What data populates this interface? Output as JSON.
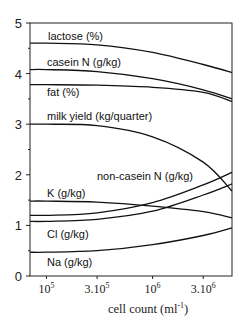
{
  "chart_data": {
    "type": "line",
    "title": "",
    "xlabel": "cell count (ml^-1)",
    "xlabel_parts": {
      "base": "cell count (ml",
      "sup": "-1",
      "end": ")"
    },
    "ylabel": "",
    "xscale": "log",
    "xlim": [
      70000,
      5600000
    ],
    "ylim": [
      0,
      5
    ],
    "grid": false,
    "legend": "inline labels",
    "y_ticks": [
      "0",
      "1",
      "2",
      "3",
      "4",
      "5"
    ],
    "x_ticks": [
      {
        "value": 100000,
        "base": "10",
        "sup": "5"
      },
      {
        "value": 300000,
        "base": "3.10",
        "sup": "5"
      },
      {
        "value": 1000000,
        "base": "10",
        "sup": "6"
      },
      {
        "value": 3000000,
        "base": "3.10",
        "sup": "6"
      }
    ],
    "x": [
      70000,
      100000,
      300000,
      1000000,
      3000000,
      5600000
    ],
    "series": [
      {
        "name": "lactose (%)",
        "values": [
          4.6,
          4.6,
          4.57,
          4.42,
          4.18,
          4.02
        ]
      },
      {
        "name": "casein N (g/kg)",
        "values": [
          4.08,
          4.08,
          4.04,
          3.9,
          3.68,
          3.5
        ]
      },
      {
        "name": "fat (%)",
        "values": [
          3.78,
          3.78,
          3.77,
          3.73,
          3.63,
          3.45
        ]
      },
      {
        "name": "milk yield (kg/quarter)",
        "values": [
          3.0,
          3.0,
          2.97,
          2.75,
          2.25,
          1.68
        ]
      },
      {
        "name": "non-casein N (g/kg)",
        "values": [
          1.2,
          1.2,
          1.25,
          1.45,
          1.8,
          2.05
        ]
      },
      {
        "name": "K (g/kg)",
        "values": [
          1.48,
          1.48,
          1.46,
          1.38,
          1.27,
          1.15
        ]
      },
      {
        "name": "Cl (g/kg)",
        "values": [
          1.08,
          1.08,
          1.12,
          1.28,
          1.6,
          1.82
        ]
      },
      {
        "name": "Na (g/kg)",
        "values": [
          0.47,
          0.47,
          0.5,
          0.62,
          0.8,
          0.95
        ]
      }
    ]
  }
}
